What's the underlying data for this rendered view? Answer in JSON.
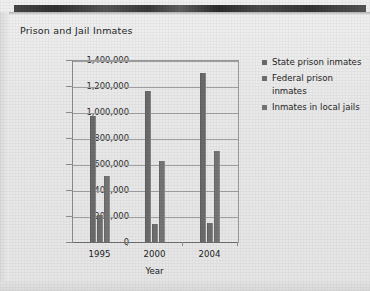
{
  "chart_data": {
    "type": "bar",
    "title": "Prison and Jail Inmates",
    "xlabel": "Year",
    "ylabel": "",
    "categories": [
      "1995",
      "2000",
      "2004"
    ],
    "series": [
      {
        "name": "State prison inmates",
        "values": [
          970000,
          1160000,
          1300000
        ]
      },
      {
        "name": "Federal prison inmates",
        "values": [
          210000,
          140000,
          145000
        ]
      },
      {
        "name": "Inmates in local jails",
        "values": [
          510000,
          620000,
          700000
        ]
      }
    ],
    "ylim": [
      0,
      1400000
    ],
    "ytick_values": [
      0,
      200000,
      400000,
      600000,
      800000,
      1000000,
      1200000,
      1400000
    ],
    "ytick_labels": [
      "0",
      "200,000",
      "400,000",
      "600,000",
      "800,000",
      "1,000,000",
      "1,200,000",
      "1,400,000"
    ],
    "grid": "horizontal",
    "legend_position": "right",
    "colors": {
      "state": "#6b6b6b",
      "federal": "#6f6f6f",
      "jails": "#757575",
      "background": "#ebebeb",
      "gridline": "#a0a0a0",
      "text": "#242424"
    }
  },
  "legend": {
    "items": [
      {
        "label": "State prison inmates"
      },
      {
        "label": "Federal prison inmates"
      },
      {
        "label": "Inmates in local jails"
      }
    ]
  }
}
